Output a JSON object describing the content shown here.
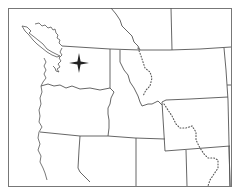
{
  "map": {
    "title": "",
    "style": "outline map",
    "colors": {
      "background": "#ffffff",
      "lines": "#555555",
      "frame": "#777777",
      "marker": "#222222"
    },
    "features": {
      "frame": "map-frame",
      "coastline": "pacific-coastline",
      "international_border": "canada-us-border",
      "state_borders": [
        "washington",
        "oregon",
        "idaho",
        "montana",
        "wyoming",
        "california",
        "nevada",
        "utah",
        "british-columbia-alberta"
      ],
      "continental_divide": "dotted-line",
      "marker": "four-point-star"
    },
    "marker": {
      "icon": "compass-star-icon",
      "location_hint": "western Washington"
    }
  }
}
